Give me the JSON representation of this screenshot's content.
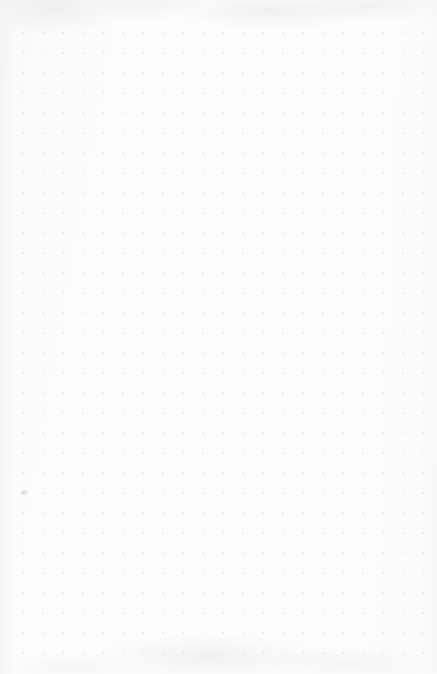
{
  "page": {
    "kind": "dot-grid-paper",
    "width": 437,
    "height": 674,
    "background_color": "#fdfdfd",
    "has_visible_text": false,
    "content_note": ""
  },
  "grid": {
    "dot_color": "#d8d8da",
    "dot_size_px": 1.6,
    "spacing_px": 20,
    "columns": 22,
    "rows": 32,
    "origin_x": 23,
    "origin_y": 33,
    "last_x": 443,
    "last_y": 653
  },
  "margins": {
    "top_px": 33,
    "left_px": 23,
    "right_px": 13,
    "bottom_px": 21
  },
  "artifacts": [
    {
      "name": "ink-smudge",
      "x": 20,
      "y": 489,
      "color": "#cecfd2"
    }
  ]
}
